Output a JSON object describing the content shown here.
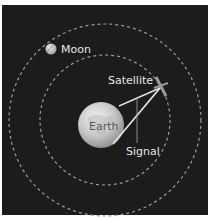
{
  "diagram": {
    "type": "orbital-schematic",
    "background_color": "#1c1c1c",
    "orbit_color": "#9a9a9a",
    "bodies": {
      "earth": {
        "label": "Earth"
      },
      "moon": {
        "label": "Moon"
      },
      "satellite": {
        "label": "Satellite"
      }
    },
    "signal": {
      "label": "Signal"
    },
    "orbits": [
      {
        "name": "satellite-orbit",
        "style": "dashed"
      },
      {
        "name": "moon-orbit",
        "style": "dashed"
      }
    ]
  }
}
